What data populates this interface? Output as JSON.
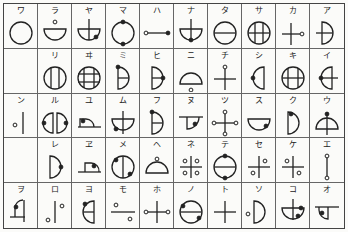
{
  "table": {
    "columns": 10,
    "rows": 5,
    "line_color": "#444444",
    "cells": [
      [
        {
          "kana": "ワ",
          "symbol": "circle"
        },
        {
          "kana": "ラ",
          "symbol": "half-circle-bottom-with-dot-above"
        },
        {
          "kana": "ヤ",
          "symbol": "half-circle-bottom-vertical-line-dot-right"
        },
        {
          "kana": "マ",
          "symbol": "circle-dots-top-bottom"
        },
        {
          "kana": "ハ",
          "symbol": "horizontal-line-dots-both-ends"
        },
        {
          "kana": "ナ",
          "symbol": "half-circle-bottom-vertical-line-dot-bottom"
        },
        {
          "kana": "タ",
          "symbol": "circle-horizontal-line"
        },
        {
          "kana": "サ",
          "symbol": "circle-two-verticals-one-horizontal"
        },
        {
          "kana": "カ",
          "symbol": "cross-dot-right"
        },
        {
          "kana": "ア",
          "symbol": "half-circle-right-horizontal-line"
        }
      ],
      [
        {
          "kana": "",
          "symbol": "empty"
        },
        {
          "kana": "リ",
          "symbol": "circle-two-verticals"
        },
        {
          "kana": "ヰ",
          "symbol": "circle-grid"
        },
        {
          "kana": "ミ",
          "symbol": "half-circle-right-horizontal-dot-top"
        },
        {
          "kana": "ヒ",
          "symbol": "half-circle-right-horizontal-dot-right"
        },
        {
          "kana": "ニ",
          "symbol": "half-circle-top-dot-below"
        },
        {
          "kana": "チ",
          "symbol": "cross-dot-top"
        },
        {
          "kana": "シ",
          "symbol": "half-circle-left-dot-left"
        },
        {
          "kana": "キ",
          "symbol": "circle-cross-grid"
        },
        {
          "kana": "イ",
          "symbol": "half-circle-left-horizontal-dot-left"
        }
      ],
      [
        {
          "kana": "ン",
          "symbol": "vertical-line-dot-left"
        },
        {
          "kana": "ル",
          "symbol": "two-half-circles-dots-outside"
        },
        {
          "kana": "ユ",
          "symbol": "quarter-shape-line-dot"
        },
        {
          "kana": "ム",
          "symbol": "half-circle-bottom-vertical-dot-left"
        },
        {
          "kana": "フ",
          "symbol": "half-circle-right-horizontal-dot-top"
        },
        {
          "kana": "ヌ",
          "symbol": "quarter-shape-down-dot"
        },
        {
          "kana": "ツ",
          "symbol": "cross-dots-four-ends"
        },
        {
          "kana": "ス",
          "symbol": "half-circle-bottom-dot-right"
        },
        {
          "kana": "ク",
          "symbol": "half-circle-right-dot-top"
        },
        {
          "kana": "ウ",
          "symbol": "half-circle-top-vertical-dot-top"
        }
      ],
      [
        {
          "kana": "",
          "symbol": "empty"
        },
        {
          "kana": "レ",
          "symbol": "half-circle-right-dot-right"
        },
        {
          "kana": "ヱ",
          "symbol": "quarter-shape-line-dot-right"
        },
        {
          "kana": "メ",
          "symbol": "circle-vertical-dots-diagonal"
        },
        {
          "kana": "ヘ",
          "symbol": "half-circle-top-dot-top"
        },
        {
          "kana": "ネ",
          "symbol": "cross-four-dots-corners"
        },
        {
          "kana": "テ",
          "symbol": "circle-horizontal-dots-top-bottom"
        },
        {
          "kana": "セ",
          "symbol": "cross-dots-tr-bl"
        },
        {
          "kana": "ケ",
          "symbol": "cross-dots-tl-br"
        },
        {
          "kana": "エ",
          "symbol": "vertical-line-dots-both-ends"
        }
      ],
      [
        {
          "kana": "ヲ",
          "symbol": "quarter-shape-left-dot"
        },
        {
          "kana": "ロ",
          "symbol": "vertical-line-dots-tr-bl"
        },
        {
          "kana": "ヨ",
          "symbol": "half-circle-left-horizontal-dot-top"
        },
        {
          "kana": "モ",
          "symbol": "horizontal-line-dots-tl-br"
        },
        {
          "kana": "ホ",
          "symbol": "cross-dots-left-right"
        },
        {
          "kana": "ノ",
          "symbol": "circle-horizontal-dots-diagonal"
        },
        {
          "kana": "ト",
          "symbol": "cross"
        },
        {
          "kana": "ソ",
          "symbol": "half-circle-right-dot-left"
        },
        {
          "kana": "コ",
          "symbol": "half-circle-bottom-vertical-dot-right"
        },
        {
          "kana": "オ",
          "symbol": "quarter-shape-down-line-dot"
        }
      ]
    ]
  }
}
